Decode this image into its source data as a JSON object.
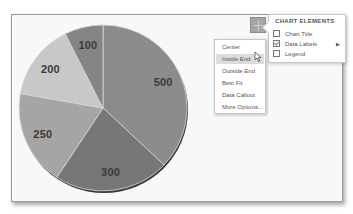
{
  "chart_data": {
    "type": "pie",
    "title": "",
    "categories": [
      "Slice 1",
      "Slice 2",
      "Slice 3",
      "Slice 4",
      "Slice 5"
    ],
    "values": [
      500,
      300,
      250,
      200,
      100
    ],
    "labels": [
      "500",
      "300",
      "250",
      "200",
      "100"
    ],
    "colors": [
      "#8c8c8c",
      "#777777",
      "#a5a5a5",
      "#c8c8c8",
      "#858585"
    ],
    "start_angle_deg": 0,
    "direction": "clockwise",
    "data_labels": "Inside End",
    "legend": false
  },
  "chart_elements_panel": {
    "title": "CHART ELEMENTS",
    "items": [
      {
        "label": "Chart Title",
        "checked": false
      },
      {
        "label": "Data Labels",
        "checked": true,
        "has_submenu": true
      },
      {
        "label": "Legend",
        "checked": false
      }
    ],
    "submenu_arrow": "▶"
  },
  "data_labels_submenu": {
    "items": [
      {
        "label": "Center"
      },
      {
        "label": "Inside End",
        "hovered": true
      },
      {
        "label": "Outside End"
      },
      {
        "label": "Best Fit"
      },
      {
        "label": "Data Callout"
      },
      {
        "label": "More Options..."
      }
    ]
  },
  "plus_button": {
    "icon": "plus-icon"
  }
}
